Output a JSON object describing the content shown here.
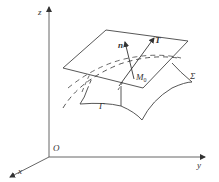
{
  "diagram": {
    "type": "3d-tangent-plane-illustration",
    "labels": {
      "z_axis": "z",
      "y_axis": "y",
      "x_axis": "x",
      "origin": "O",
      "normal_vector": "n",
      "tangent_vector": "T",
      "point": "M",
      "point_subscript": "0",
      "surface": "Σ",
      "curve": "Γ"
    },
    "colors": {
      "line": "#444444",
      "axis": "#555555",
      "text": "#333333",
      "background": "#ffffff"
    }
  }
}
